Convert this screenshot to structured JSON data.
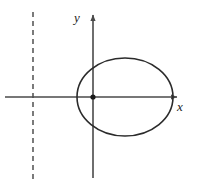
{
  "figure": {
    "background_color": "#ffffff",
    "stroke_color": "#2b2b2b",
    "axis_color": "#4a4a4a",
    "dash_color": "#5a5a5a"
  },
  "axes": {
    "x_axis": {
      "label": "x",
      "label_x": 180,
      "label_y": 111,
      "start_x": 5,
      "end_x": 181,
      "y": 97,
      "arrow": "right"
    },
    "y_axis": {
      "label": "y",
      "label_x": 77,
      "label_y": 22,
      "x": 93,
      "start_y": 178,
      "end_y": 11,
      "arrow": "up"
    }
  },
  "origin_marker": {
    "name": "center-point",
    "x": 93,
    "y": 97,
    "radius": 2.6
  },
  "ellipse": {
    "center_x": 125,
    "center_y": 97,
    "radius_x": 48,
    "radius_y": 39,
    "stroke_width": 1.6
  },
  "directrix": {
    "x": 33,
    "top_y": 12,
    "bottom_y": 183,
    "dash_pattern": "5 4",
    "stroke_width": 1.6
  }
}
